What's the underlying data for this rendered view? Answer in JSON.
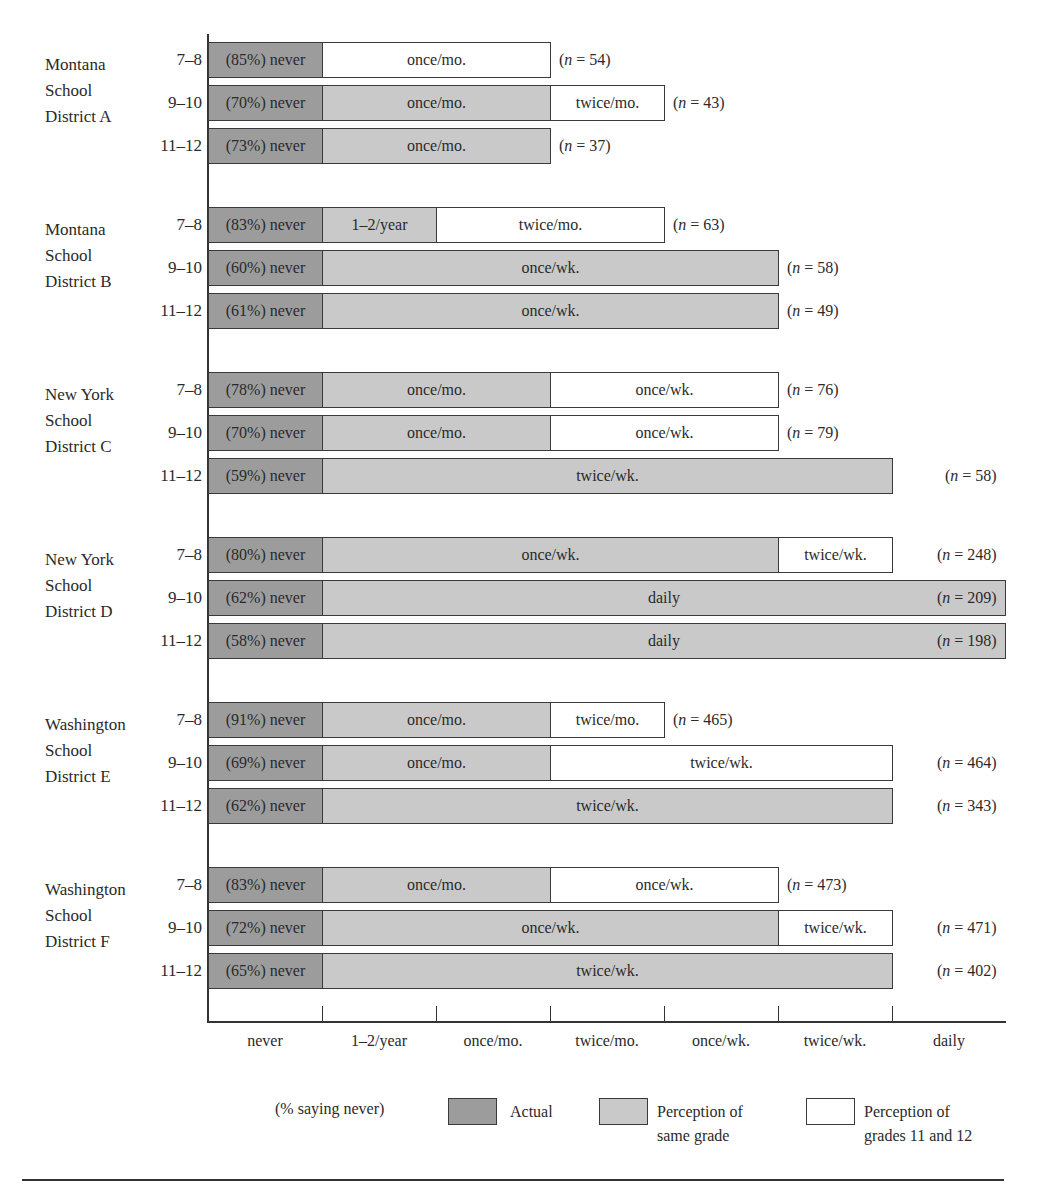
{
  "chart_data": {
    "type": "bar",
    "orientation": "horizontal-stacked",
    "title": "",
    "xlabel": "",
    "ylabel": "",
    "categories_axis": [
      "never",
      "1–2/year",
      "once/mo.",
      "twice/mo.",
      "once/wk.",
      "twice/wk.",
      "daily"
    ],
    "legend": {
      "note": "(% saying never)",
      "entries": [
        {
          "key": "actual",
          "label": "Actual",
          "color": "#9c9c9c"
        },
        {
          "key": "same",
          "label": "Perception of\nsame grade",
          "color": "#c9c9c9"
        },
        {
          "key": "upper",
          "label": "Perception of\ngrades 11 and 12",
          "color": "#ffffff"
        }
      ],
      "position": "bottom"
    },
    "groups": [
      {
        "district": "Montana\nSchool\nDistrict A",
        "rows": [
          {
            "grade": "7–8",
            "actual_never_pct": 85,
            "actual_label": "(85%) never",
            "same_grade_perception": null,
            "upper_grade_perception": "once/mo.",
            "n": 54,
            "n_label": "= 54)"
          },
          {
            "grade": "9–10",
            "actual_never_pct": 70,
            "actual_label": "(70%) never",
            "same_grade_perception": "once/mo.",
            "upper_grade_perception": "twice/mo.",
            "n": 43,
            "n_label": "= 43)"
          },
          {
            "grade": "11–12",
            "actual_never_pct": 73,
            "actual_label": "(73%) never",
            "same_grade_perception": "once/mo.",
            "upper_grade_perception": null,
            "n": 37,
            "n_label": "= 37)"
          }
        ]
      },
      {
        "district": "Montana\nSchool\nDistrict B",
        "rows": [
          {
            "grade": "7–8",
            "actual_never_pct": 83,
            "actual_label": "(83%) never",
            "same_grade_perception": "1–2/year",
            "upper_grade_perception": "twice/mo.",
            "n": 63,
            "n_label": "= 63)"
          },
          {
            "grade": "9–10",
            "actual_never_pct": 60,
            "actual_label": "(60%) never",
            "same_grade_perception": "once/wk.",
            "upper_grade_perception": null,
            "n": 58,
            "n_label": "= 58)"
          },
          {
            "grade": "11–12",
            "actual_never_pct": 61,
            "actual_label": "(61%) never",
            "same_grade_perception": "once/wk.",
            "upper_grade_perception": null,
            "n": 49,
            "n_label": "= 49)"
          }
        ]
      },
      {
        "district": "New York\nSchool\nDistrict C",
        "rows": [
          {
            "grade": "7–8",
            "actual_never_pct": 78,
            "actual_label": "(78%) never",
            "same_grade_perception": "once/mo.",
            "upper_grade_perception": "once/wk.",
            "n": 76,
            "n_label": "= 76)"
          },
          {
            "grade": "9–10",
            "actual_never_pct": 70,
            "actual_label": "(70%) never",
            "same_grade_perception": "once/mo.",
            "upper_grade_perception": "once/wk.",
            "n": 79,
            "n_label": "= 79)"
          },
          {
            "grade": "11–12",
            "actual_never_pct": 59,
            "actual_label": "(59%) never",
            "same_grade_perception": "twice/wk.",
            "upper_grade_perception": null,
            "n": 58,
            "n_label": "= 58)"
          }
        ]
      },
      {
        "district": "New York\nSchool\nDistrict D",
        "rows": [
          {
            "grade": "7–8",
            "actual_never_pct": 80,
            "actual_label": "(80%) never",
            "same_grade_perception": "once/wk.",
            "upper_grade_perception": "twice/wk.",
            "n": 248,
            "n_label": "= 248)"
          },
          {
            "grade": "9–10",
            "actual_never_pct": 62,
            "actual_label": "(62%) never",
            "same_grade_perception": "daily",
            "upper_grade_perception": null,
            "n": 209,
            "n_label": "= 209)"
          },
          {
            "grade": "11–12",
            "actual_never_pct": 58,
            "actual_label": "(58%) never",
            "same_grade_perception": "daily",
            "upper_grade_perception": null,
            "n": 198,
            "n_label": "= 198)"
          }
        ]
      },
      {
        "district": "Washington\nSchool\nDistrict E",
        "rows": [
          {
            "grade": "7–8",
            "actual_never_pct": 91,
            "actual_label": "(91%) never",
            "same_grade_perception": "once/mo.",
            "upper_grade_perception": "twice/mo.",
            "n": 465,
            "n_label": "= 465)"
          },
          {
            "grade": "9–10",
            "actual_never_pct": 69,
            "actual_label": "(69%) never",
            "same_grade_perception": "once/mo.",
            "upper_grade_perception": "twice/wk.",
            "n": 464,
            "n_label": "= 464)"
          },
          {
            "grade": "11–12",
            "actual_never_pct": 62,
            "actual_label": "(62%) never",
            "same_grade_perception": "twice/wk.",
            "upper_grade_perception": null,
            "n": 343,
            "n_label": "= 343)"
          }
        ]
      },
      {
        "district": "Washington\nSchool\nDistrict F",
        "rows": [
          {
            "grade": "7–8",
            "actual_never_pct": 83,
            "actual_label": "(83%) never",
            "same_grade_perception": "once/mo.",
            "upper_grade_perception": "once/wk.",
            "n": 473,
            "n_label": "= 473)"
          },
          {
            "grade": "9–10",
            "actual_never_pct": 72,
            "actual_label": "(72%) never",
            "same_grade_perception": "once/wk.",
            "upper_grade_perception": "twice/wk.",
            "n": 471,
            "n_label": "= 471)"
          },
          {
            "grade": "11–12",
            "actual_never_pct": 65,
            "actual_label": "(65%) never",
            "same_grade_perception": "twice/wk.",
            "upper_grade_perception": null,
            "n": 402,
            "n_label": "= 402)"
          }
        ]
      }
    ]
  }
}
